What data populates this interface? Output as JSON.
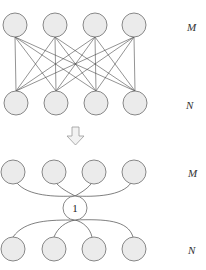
{
  "top_diagram": {
    "title": "Fully connected bipartite layers",
    "layer_labels": {
      "upper": "M",
      "lower": "N"
    },
    "upper_nodes": [
      {
        "cx": 15,
        "cy": 25
      },
      {
        "cx": 55,
        "cy": 25
      },
      {
        "cx": 95,
        "cy": 25
      },
      {
        "cx": 134,
        "cy": 25
      }
    ],
    "lower_nodes": [
      {
        "cx": 16,
        "cy": 103
      },
      {
        "cx": 56,
        "cy": 103
      },
      {
        "cx": 96,
        "cy": 103
      },
      {
        "cx": 135,
        "cy": 103
      }
    ],
    "node_radius": 12,
    "connections": "all-to-all"
  },
  "transform_arrow": {
    "direction": "down",
    "icon": "down-arrow-icon"
  },
  "bottom_diagram": {
    "title": "Layers connected through a single hub node",
    "layer_labels": {
      "upper": "M",
      "lower": "N"
    },
    "hub_label": "1",
    "hub": {
      "cx": 75,
      "cy": 208,
      "r": 12
    },
    "upper_nodes": [
      {
        "cx": 13,
        "cy": 172
      },
      {
        "cx": 54,
        "cy": 172
      },
      {
        "cx": 94,
        "cy": 172
      },
      {
        "cx": 134,
        "cy": 172
      }
    ],
    "lower_nodes": [
      {
        "cx": 13,
        "cy": 249
      },
      {
        "cx": 54,
        "cy": 249
      },
      {
        "cx": 94,
        "cy": 249
      },
      {
        "cx": 134,
        "cy": 249
      }
    ],
    "node_radius": 12
  },
  "colors": {
    "node_fill": "#ebebeb",
    "node_stroke": "#7a7a7a",
    "edge": "#3a3a3a",
    "background": "#ffffff"
  }
}
